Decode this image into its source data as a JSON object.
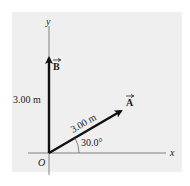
{
  "diagram": {
    "axes": {
      "x_label": "x",
      "y_label": "y",
      "origin_label": "O"
    },
    "vectors": [
      {
        "name": "A",
        "label": "A",
        "magnitude_label": "3.00 m",
        "magnitude": 3.0,
        "unit": "m",
        "angle_deg": 30.0,
        "angle_label": "30.0°",
        "direction": "30.0° above +x axis"
      },
      {
        "name": "B",
        "label": "B",
        "magnitude_label": "3.00 m",
        "magnitude": 3.0,
        "unit": "m",
        "angle_deg": 90.0,
        "direction": "along +y axis"
      }
    ],
    "colors": {
      "background": "#efefef",
      "vector": "#111111",
      "axis": "#555555",
      "text": "#1a1a1a"
    }
  }
}
